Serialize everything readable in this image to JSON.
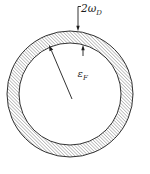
{
  "diagram": {
    "background": "#ffffff",
    "ink_color": "#1c1c1c",
    "hatch_color": "#6e6e6e",
    "shell_width_label": {
      "text": "2ω",
      "subscript": "D"
    },
    "fermi_energy_label": {
      "text": "ε",
      "subscript": "F"
    }
  }
}
